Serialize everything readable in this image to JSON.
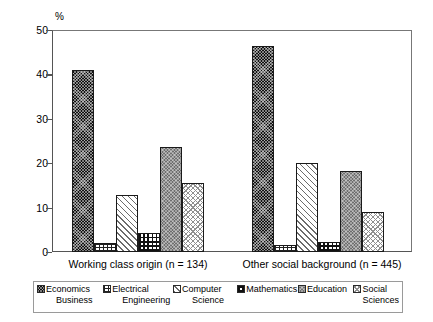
{
  "chart_data": {
    "type": "bar",
    "title": "",
    "subtitle": "",
    "xlabel": "",
    "ylabel": "%",
    "ylim": [
      0,
      50
    ],
    "yticks": [
      0,
      10,
      20,
      30,
      40,
      50
    ],
    "grid": false,
    "legend_position": "bottom",
    "categories": [
      "Working class origin (n = 134)",
      "Other social background (n = 445)"
    ],
    "series": [
      {
        "name": "Economics Business",
        "name_line1": "Economics",
        "name_line2": "Business",
        "pattern": "dense-checker-black",
        "values": [
          41.0,
          46.3
        ]
      },
      {
        "name": "Electrical Engineering",
        "name_line1": "Electrical",
        "name_line2": "Engineering",
        "pattern": "brick-hatch",
        "values": [
          2.0,
          1.5
        ]
      },
      {
        "name": "Computer Science",
        "name_line1": "Computer",
        "name_line2": "Science",
        "pattern": "diagonal-hatch",
        "values": [
          12.8,
          20.0
        ]
      },
      {
        "name": "Mathematics",
        "name_line1": "Mathematics",
        "name_line2": "",
        "pattern": "bold-grid-plaid",
        "values": [
          4.3,
          2.2
        ]
      },
      {
        "name": "Education",
        "name_line1": "Education",
        "name_line2": "",
        "pattern": "gray-checker",
        "values": [
          23.7,
          18.3
        ]
      },
      {
        "name": "Social Sciences",
        "name_line1": "Social",
        "name_line2": "Sciences",
        "pattern": "light-dot",
        "values": [
          15.6,
          9.0
        ]
      }
    ]
  },
  "axis": {
    "y_unit": "%",
    "tick_labels": [
      "50",
      "40",
      "30",
      "20",
      "10",
      "0"
    ]
  },
  "colors": {
    "frame": "#555555",
    "economics": "#111111",
    "education": "#6e6e6e",
    "hatch": "#6b6b6b",
    "background": "#ffffff"
  }
}
